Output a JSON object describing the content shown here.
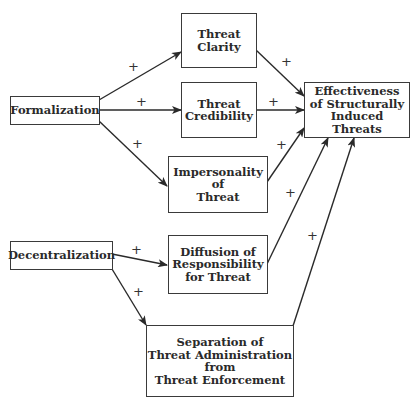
{
  "diagram": {
    "nodes": {
      "formalization": "Formalization",
      "decentralization": "Decentralization",
      "threat_clarity": "Threat\nClarity",
      "threat_credibility": "Threat\nCredibility",
      "impersonality": "Impersonality\nof\nThreat",
      "diffusion": "Diffusion of\nResponsibility\nfor Threat",
      "separation": "Separation of\nThreat Administration\nfrom\nThreat Enforcement",
      "effectiveness": "Effectiveness\nof Structurally\nInduced Threats"
    },
    "edges": [
      {
        "from": "Formalization",
        "to": "Threat Clarity",
        "sign": "+"
      },
      {
        "from": "Formalization",
        "to": "Threat Credibility",
        "sign": "+"
      },
      {
        "from": "Formalization",
        "to": "Impersonality of Threat",
        "sign": "+"
      },
      {
        "from": "Decentralization",
        "to": "Diffusion of Responsibility for Threat",
        "sign": "+"
      },
      {
        "from": "Decentralization",
        "to": "Separation of Threat Administration from Threat Enforcement",
        "sign": "+"
      },
      {
        "from": "Threat Clarity",
        "to": "Effectiveness of Structurally Induced Threats",
        "sign": "+"
      },
      {
        "from": "Threat Credibility",
        "to": "Effectiveness of Structurally Induced Threats",
        "sign": "+"
      },
      {
        "from": "Impersonality of Threat",
        "to": "Effectiveness of Structurally Induced Threats",
        "sign": "+"
      },
      {
        "from": "Diffusion of Responsibility for Threat",
        "to": "Effectiveness of Structurally Induced Threats",
        "sign": "+"
      },
      {
        "from": "Separation of Threat Administration from Threat Enforcement",
        "to": "Effectiveness of Structurally Induced Threats",
        "sign": "+"
      }
    ],
    "sign_label": "+"
  }
}
